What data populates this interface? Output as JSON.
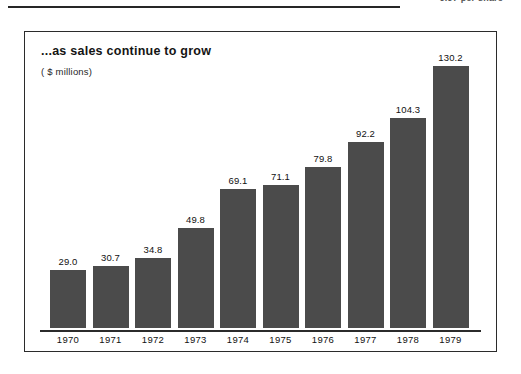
{
  "header": {
    "per_share_note": "9.97 per share",
    "rule": "horizontal-rule"
  },
  "chart_data": {
    "type": "bar",
    "title": "...as sales continue to grow",
    "subtitle": "( $ millions)",
    "xlabel": "",
    "ylabel": "",
    "unit": "$ millions",
    "grid": false,
    "legend": "none",
    "ylim": [
      0,
      130.2
    ],
    "axis_baseline": true,
    "bar_color": "#4b4b4b",
    "categories": [
      "1970",
      "1971",
      "1972",
      "1973",
      "1974",
      "1975",
      "1976",
      "1977",
      "1978",
      "1979"
    ],
    "values": [
      29.0,
      30.7,
      34.8,
      49.8,
      69.1,
      71.1,
      79.8,
      92.2,
      104.3,
      130.2
    ],
    "labels": [
      "29.0",
      "30.7",
      "34.8",
      "49.8",
      "69.1",
      "71.1",
      "79.8",
      "92.2",
      "104.3",
      "130.2"
    ]
  }
}
